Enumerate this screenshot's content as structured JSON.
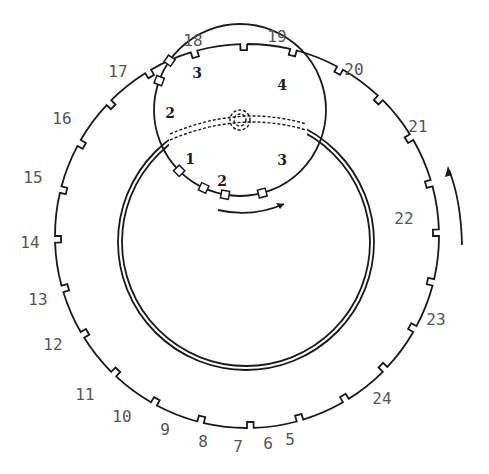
{
  "diagram": {
    "type": "gear-ring-diagram",
    "outer_ring": {
      "center": [
        247,
        236
      ],
      "radius": 192,
      "tooth_labels": [
        "5",
        "6",
        "7",
        "8",
        "9",
        "10",
        "11",
        "12",
        "13",
        "14",
        "15",
        "16",
        "17",
        "18",
        "19",
        "20",
        "21",
        "22",
        "23",
        "24"
      ],
      "label_positions": [
        {
          "text": "5",
          "x": 290,
          "y": 445
        },
        {
          "text": "6",
          "x": 268,
          "y": 449
        },
        {
          "text": "7",
          "x": 238,
          "y": 452
        },
        {
          "text": "8",
          "x": 203,
          "y": 447
        },
        {
          "text": "9",
          "x": 165,
          "y": 435
        },
        {
          "text": "10",
          "x": 122,
          "y": 422
        },
        {
          "text": "11",
          "x": 85,
          "y": 400
        },
        {
          "text": "12",
          "x": 53,
          "y": 350
        },
        {
          "text": "13",
          "x": 38,
          "y": 305
        },
        {
          "text": "14",
          "x": 30,
          "y": 248
        },
        {
          "text": "15",
          "x": 33,
          "y": 183
        },
        {
          "text": "16",
          "x": 62,
          "y": 124
        },
        {
          "text": "17",
          "x": 118,
          "y": 77
        },
        {
          "text": "18",
          "x": 193,
          "y": 46
        },
        {
          "text": "19",
          "x": 277,
          "y": 42
        },
        {
          "text": "20",
          "x": 354,
          "y": 75
        },
        {
          "text": "21",
          "x": 418,
          "y": 132
        },
        {
          "text": "22",
          "x": 404,
          "y": 224
        },
        {
          "text": "23",
          "x": 436,
          "y": 325
        },
        {
          "text": "24",
          "x": 382,
          "y": 404
        }
      ]
    },
    "inner_double_ring": {
      "center": [
        246,
        242
      ],
      "radius": 128
    },
    "small_gear": {
      "center": [
        240,
        110
      ],
      "radius": 86,
      "labels": [
        {
          "text": "1",
          "x": 190,
          "y": 164
        },
        {
          "text": "2",
          "x": 222,
          "y": 186
        },
        {
          "text": "3",
          "x": 282,
          "y": 165
        },
        {
          "text": "2",
          "x": 170,
          "y": 118
        },
        {
          "text": "3",
          "x": 197,
          "y": 78
        },
        {
          "text": "4",
          "x": 282,
          "y": 90
        }
      ]
    },
    "arrows": {
      "small_gear_rotation": "clockwise-arrow",
      "outer_ring_rotation": "counterclockwise-arrow"
    }
  }
}
